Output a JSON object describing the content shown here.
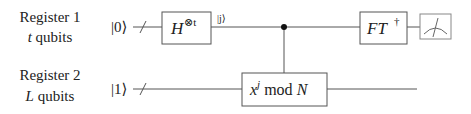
{
  "diagram": {
    "type": "quantum-circuit",
    "title": "",
    "registers": [
      {
        "name": "Register 1",
        "size_label": "t qubits",
        "size_var": "t",
        "size_suffix": "qubits",
        "init_state": "|0⟩",
        "init_state_digit": "0"
      },
      {
        "name": "Register 2",
        "size_label": "L qubits",
        "size_var": "L",
        "size_suffix": "qubits",
        "init_state": "|1⟩",
        "init_state_digit": "1"
      }
    ],
    "gates": [
      {
        "id": "hadamard",
        "register": 1,
        "label": "H⊗t",
        "base": "H",
        "superscript": "⊗t"
      },
      {
        "id": "modexp",
        "register": 2,
        "label": "x^j mod N",
        "base": "x",
        "superscript": "j",
        "suffix": "mod",
        "modulus": "N",
        "controlled_by": 1
      },
      {
        "id": "inverse-qft",
        "register": 1,
        "label": "FT†",
        "base": "FT",
        "superscript": "†"
      },
      {
        "id": "measurement",
        "register": 1,
        "label": "meter"
      }
    ],
    "wire_labels": [
      {
        "register": 1,
        "after_gate": "hadamard",
        "text": "|j⟩",
        "var": "j"
      }
    ],
    "colors": {
      "line": "#555555",
      "text": "#222222",
      "background": "#ffffff"
    }
  }
}
